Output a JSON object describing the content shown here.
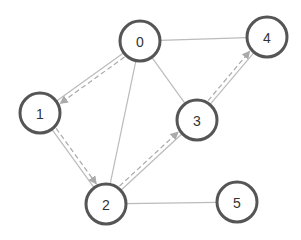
{
  "diagram": {
    "type": "graph",
    "node_radius": 20,
    "colors": {
      "node_stroke": "#555555",
      "node_fill": "#ffffff",
      "edge": "#bbbbbb",
      "path_edge": "#aaaaaa",
      "arrowhead": "#aaaaaa",
      "label": "#333333"
    },
    "nodes": [
      {
        "id": "0",
        "label": "0",
        "x": 140,
        "y": 41
      },
      {
        "id": "1",
        "label": "1",
        "x": 40,
        "y": 113
      },
      {
        "id": "2",
        "label": "2",
        "x": 106,
        "y": 204
      },
      {
        "id": "3",
        "label": "3",
        "x": 197,
        "y": 120
      },
      {
        "id": "4",
        "label": "4",
        "x": 267,
        "y": 37
      },
      {
        "id": "5",
        "label": "5",
        "x": 237,
        "y": 202
      }
    ],
    "edges": [
      {
        "from": "0",
        "to": "1"
      },
      {
        "from": "0",
        "to": "2"
      },
      {
        "from": "0",
        "to": "3"
      },
      {
        "from": "0",
        "to": "4"
      },
      {
        "from": "1",
        "to": "2"
      },
      {
        "from": "2",
        "to": "3"
      },
      {
        "from": "2",
        "to": "5"
      },
      {
        "from": "3",
        "to": "4"
      }
    ],
    "highlighted_path": [
      {
        "from": "0",
        "to": "1"
      },
      {
        "from": "1",
        "to": "2"
      },
      {
        "from": "2",
        "to": "3"
      },
      {
        "from": "3",
        "to": "4"
      }
    ]
  }
}
